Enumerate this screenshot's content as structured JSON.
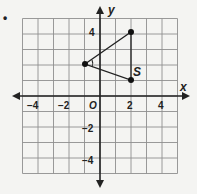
{
  "bullet": "•",
  "axes": {
    "x_label": "x",
    "y_label": "y",
    "origin_label": "O",
    "x_ticks": [
      "−4",
      "−2",
      "2",
      "4"
    ],
    "y_ticks": [
      "4",
      "−2",
      "−4"
    ]
  },
  "grid": {
    "xmin": -5,
    "xmax": 5,
    "ymin": -5,
    "ymax": 5,
    "step": 1
  },
  "triangle": {
    "vertices": [
      {
        "x": -1,
        "y": 2,
        "label": ""
      },
      {
        "x": 2,
        "y": 4,
        "label": ""
      },
      {
        "x": 2,
        "y": 1,
        "label": "S"
      }
    ],
    "angle_marker_at": {
      "x": -1,
      "y": 2
    }
  },
  "colors": {
    "grid": "#8a8a8a",
    "axis": "#222222",
    "shape": "#222222",
    "background": "#f4f4f2"
  }
}
